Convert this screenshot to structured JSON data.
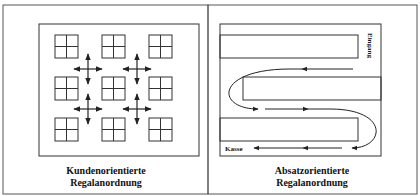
{
  "figure": {
    "panels": [
      {
        "id": "kundenorientiert",
        "caption_line1": "Kundenorientierte",
        "caption_line2": "Regalanordnung",
        "layout": "grid",
        "shelf_grid": {
          "rows": 3,
          "cols": 3
        },
        "arrow_crosses": 4
      },
      {
        "id": "absatzorientiert",
        "caption_line1": "Absatzorientierte",
        "caption_line2": "Regalanordnung",
        "layout": "serpentine",
        "entrance_label": "Eingang",
        "checkout_label": "Kasse",
        "shelves": 3
      }
    ]
  },
  "colors": {
    "line": "#222222",
    "background": "#ffffff"
  }
}
